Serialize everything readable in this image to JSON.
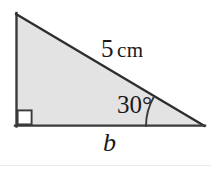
{
  "figure": {
    "shape": "right triangle",
    "fill_color": "#e3e3e3",
    "stroke_color": "#3a3a3a",
    "background_color": "#ffffff",
    "vertices": {
      "top_left": [
        16,
        14
      ],
      "bottom_left": [
        16,
        126
      ],
      "right": [
        204,
        126
      ]
    },
    "right_angle_marker": {
      "name": "right-angle-square",
      "corner": [
        16,
        126
      ],
      "size_px": 14,
      "fill": "#ffffff"
    },
    "angle_arc": {
      "center": [
        204,
        126
      ],
      "radius_px": 58,
      "from_degrees": 180,
      "to_degrees": 150
    }
  },
  "labels": {
    "hypotenuse_value": "5",
    "hypotenuse_unit": "cm",
    "angle": "30°",
    "base": "b"
  }
}
